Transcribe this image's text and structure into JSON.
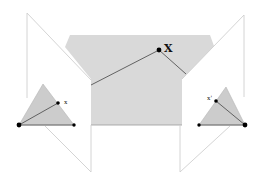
{
  "diagram": {
    "type": "epipolar-geometry",
    "labels": {
      "world_point": "X",
      "left_image_point": "x",
      "right_image_point": "x'"
    },
    "colors": {
      "plane_fill": "#d9d9d9",
      "plane_edge": "#cfcfcf",
      "ray_line": "#555555",
      "point": "#000000",
      "triangle_fill": "#cccccc"
    }
  }
}
